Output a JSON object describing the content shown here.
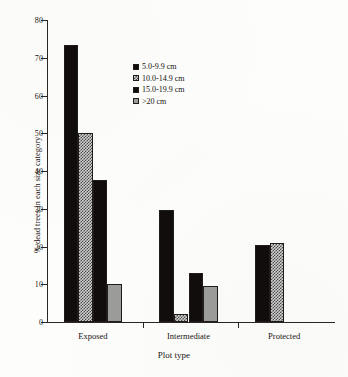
{
  "chart_data": {
    "type": "bar",
    "title": "",
    "subtitle": "",
    "xlabel": "Plot type",
    "ylabel": "% dead trees in each size category",
    "categories": [
      "Exposed",
      "Intermediate",
      "Protected"
    ],
    "series": [
      {
        "name": "5.0-9.9 cm",
        "values": [
          73.5,
          29.8,
          20.3
        ],
        "fill": "solid-black",
        "color": "#100d0c"
      },
      {
        "name": "10.0-14.9 cm",
        "values": [
          50.1,
          2.0,
          20.8
        ],
        "fill": "hatch-check",
        "color": "#8d8d8b"
      },
      {
        "name": "15.0-19.9 cm",
        "values": [
          37.7,
          13.0,
          0
        ],
        "fill": "solid-black",
        "color": "#100d0c"
      },
      {
        "name": ">20 cm",
        "values": [
          10.2,
          9.6,
          0
        ],
        "fill": "solid-gray",
        "color": "#9b9b99"
      }
    ],
    "ylim": [
      0,
      80
    ],
    "yticks": [
      0,
      10,
      20,
      30,
      40,
      50,
      60,
      70,
      80
    ],
    "ytick_labels": [
      "0",
      "10",
      "20",
      "30",
      "40",
      "50",
      "60",
      "70",
      "80"
    ],
    "grid": false,
    "legend_position": "upper-center",
    "legend_entries": [
      "5.0-9.9 cm",
      "10.0-14.9 cm",
      "15.0-19.9 cm",
      ">20 cm"
    ],
    "annotations": []
  }
}
